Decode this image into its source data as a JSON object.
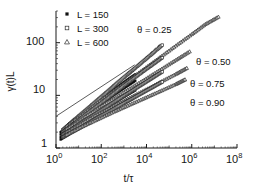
{
  "figure": {
    "background": "#ffffff",
    "axis_color": "#1a1a1a"
  },
  "axes": {
    "ylabel": "γ(t)L",
    "xlabel": "t/τ",
    "x_ticks": [
      {
        "mantissa": "10",
        "exp": "0"
      },
      {
        "mantissa": "10",
        "exp": "2"
      },
      {
        "mantissa": "10",
        "exp": "4"
      },
      {
        "mantissa": "10",
        "exp": "6"
      },
      {
        "mantissa": "10",
        "exp": "8"
      }
    ],
    "y_ticks": [
      "1",
      "10",
      "100"
    ]
  },
  "legend": {
    "entries": [
      {
        "label": "L = 150",
        "marker": "filled-square",
        "color": "#111111"
      },
      {
        "label": "L = 300",
        "marker": "open-square",
        "color": "#333333"
      },
      {
        "label": "L = 600",
        "marker": "open-triangle",
        "color": "#444444"
      }
    ]
  },
  "annotations": [
    {
      "text": "θ = 0.25",
      "x": 137,
      "y": 36
    },
    {
      "text": "θ = 0.50",
      "x": 196,
      "y": 63
    },
    {
      "text": "θ = 0.75",
      "x": 190,
      "y": 85
    },
    {
      "text": "θ = 0.90",
      "x": 190,
      "y": 104
    }
  ],
  "chart_data": {
    "type": "scatter",
    "title": "",
    "xlabel": "t/τ",
    "ylabel": "γ(t)L",
    "xscale": "log",
    "yscale": "log",
    "xlim": [
      1,
      100000000
    ],
    "ylim": [
      1,
      400
    ],
    "grid": false,
    "legend_position": "top-left",
    "markers": {
      "L = 150": "filled-square",
      "L = 300": "open-square",
      "L = 600": "open-triangle"
    },
    "guide_lines": [
      {
        "name": "solid-guide",
        "style": "solid",
        "x": [
          1,
          3000
        ],
        "y": [
          4.0,
          38.0
        ],
        "note": "power-law reference line, low-theta slope"
      },
      {
        "name": "dashed-guide",
        "style": "dashed",
        "x": [
          300,
          40000
        ],
        "y": [
          13.0,
          95.0
        ],
        "note": "power-law reference line above theta=0.25 branch"
      }
    ],
    "series": [
      {
        "name": "θ = 0.25, L = 150",
        "theta": 0.25,
        "L": 150,
        "marker": "filled-square",
        "x": [
          1.6,
          3.2,
          6.3,
          13,
          25,
          50,
          100,
          200,
          400,
          800,
          1600,
          3200
        ],
        "y": [
          2.0,
          2.6,
          3.3,
          4.2,
          5.3,
          6.7,
          8.4,
          10.6,
          13.3,
          16.5,
          20.5,
          25.0
        ]
      },
      {
        "name": "θ = 0.25, L = 300",
        "theta": 0.25,
        "L": 300,
        "marker": "open-square",
        "x": [
          2.0,
          5.0,
          13,
          32,
          80,
          200,
          500,
          1300,
          3200,
          8000,
          20000,
          50000
        ],
        "y": [
          2.2,
          3.1,
          4.4,
          6.1,
          8.6,
          12.0,
          17.0,
          24.0,
          33.0,
          46.0,
          64.0,
          90.0
        ]
      },
      {
        "name": "θ = 0.25, L = 600",
        "theta": 0.25,
        "L": 600,
        "marker": "open-triangle",
        "x": [
          3.0,
          13,
          60,
          300,
          1500,
          8000,
          40000,
          200000,
          1000000,
          4000000,
          15000000
        ],
        "y": [
          2.6,
          4.2,
          7.0,
          11.5,
          19.0,
          32.0,
          53.0,
          88.0,
          145.0,
          225.0,
          310.0
        ]
      },
      {
        "name": "θ = 0.50, L = 150",
        "theta": 0.5,
        "L": 150,
        "marker": "filled-square",
        "x": [
          1.6,
          3.2,
          6.3,
          13,
          25,
          50,
          100,
          200,
          400,
          800,
          1600,
          3200
        ],
        "y": [
          1.8,
          2.3,
          2.9,
          3.6,
          4.5,
          5.6,
          6.9,
          8.5,
          10.5,
          12.8,
          15.6,
          19.0
        ]
      },
      {
        "name": "θ = 0.50, L = 300",
        "theta": 0.5,
        "L": 300,
        "marker": "open-square",
        "x": [
          2.0,
          5.0,
          13,
          32,
          80,
          200,
          500,
          1300,
          3200,
          8000,
          20000,
          50000
        ],
        "y": [
          2.0,
          2.7,
          3.7,
          5.0,
          6.7,
          9.0,
          12.2,
          16.5,
          22.0,
          29.5,
          39.0,
          52.0
        ]
      },
      {
        "name": "θ = 0.50, L = 600",
        "theta": 0.5,
        "L": 600,
        "marker": "open-triangle",
        "x": [
          3.0,
          13,
          60,
          300,
          1500,
          8000,
          40000,
          200000,
          800000
        ],
        "y": [
          2.3,
          3.5,
          5.4,
          8.3,
          12.8,
          19.8,
          30.5,
          47.0,
          68.0
        ]
      },
      {
        "name": "θ = 0.75, L = 150",
        "theta": 0.75,
        "L": 150,
        "marker": "filled-square",
        "x": [
          1.6,
          3.2,
          6.3,
          13,
          25,
          50,
          100,
          200,
          400,
          800,
          1600,
          3200
        ],
        "y": [
          1.6,
          2.0,
          2.4,
          2.9,
          3.5,
          4.2,
          5.1,
          6.1,
          7.3,
          8.8,
          10.5,
          12.5
        ]
      },
      {
        "name": "θ = 0.75, L = 300",
        "theta": 0.75,
        "L": 300,
        "marker": "open-square",
        "x": [
          2.0,
          5.0,
          13,
          32,
          80,
          200,
          500,
          1300,
          3200,
          8000,
          20000,
          50000
        ],
        "y": [
          1.8,
          2.3,
          3.0,
          3.8,
          4.9,
          6.3,
          8.1,
          10.4,
          13.3,
          17.0,
          21.8,
          28.0
        ]
      },
      {
        "name": "θ = 0.75, L = 600",
        "theta": 0.75,
        "L": 600,
        "marker": "open-triangle",
        "x": [
          3.0,
          13,
          60,
          300,
          1500,
          8000,
          40000,
          200000,
          600000
        ],
        "y": [
          2.0,
          2.9,
          4.2,
          6.0,
          8.6,
          12.4,
          17.8,
          25.5,
          33.0
        ]
      },
      {
        "name": "θ = 0.90, L = 150",
        "theta": 0.9,
        "L": 150,
        "marker": "filled-square",
        "x": [
          1.6,
          3.2,
          6.3,
          13,
          25,
          50,
          100,
          200,
          400,
          800,
          1600,
          3200
        ],
        "y": [
          1.45,
          1.75,
          2.1,
          2.5,
          2.95,
          3.5,
          4.15,
          4.9,
          5.8,
          6.8,
          8.0,
          9.4
        ]
      },
      {
        "name": "θ = 0.90, L = 300",
        "theta": 0.9,
        "L": 300,
        "marker": "open-square",
        "x": [
          2.0,
          5.0,
          13,
          32,
          80,
          200,
          500,
          1300,
          3200,
          8000,
          20000,
          50000
        ],
        "y": [
          1.6,
          2.0,
          2.5,
          3.1,
          3.9,
          4.8,
          6.0,
          7.5,
          9.3,
          11.6,
          14.4,
          18.0
        ]
      },
      {
        "name": "θ = 0.90, L = 600",
        "theta": 0.9,
        "L": 600,
        "marker": "open-triangle",
        "x": [
          3.0,
          13,
          60,
          300,
          1500,
          8000,
          40000,
          200000,
          500000
        ],
        "y": [
          1.8,
          2.5,
          3.4,
          4.7,
          6.4,
          8.8,
          12.0,
          16.4,
          20.0
        ]
      }
    ]
  }
}
